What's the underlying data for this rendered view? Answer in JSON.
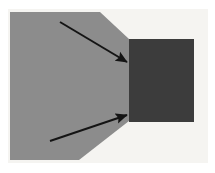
{
  "figure": {
    "title": "Grayscale schematic: wedge-shaped gray region meeting a dark rectangular block",
    "width": 215,
    "height": 173,
    "background_color": "#f5f4f1",
    "canvas_color": "#ffffff"
  },
  "colors": {
    "background": "#f5f4f1",
    "gray_region": "#8c8c8c",
    "dark_block": "#3c3c3c",
    "arrow": "#141414",
    "page": "#ffffff"
  },
  "shapes": {
    "gray_region": {
      "name": "gray-wedge-region",
      "fill": "#8c8c8c",
      "description": "Large gray polygon occupying the left portion, with chamfered upper-right and lower-right corners converging toward the dark block",
      "points": "10,12 100,12 129,39 129,121 79,160 10,160"
    },
    "dark_block": {
      "name": "dark-rectangular-block",
      "fill": "#3c3c3c",
      "description": "Dark charcoal rectangle abutting the right side of the gray region",
      "x": 129,
      "y": 39,
      "width": 65,
      "height": 83
    },
    "background_panel": {
      "name": "figure-background-panel",
      "fill": "#f5f4f1",
      "x": 8,
      "y": 9,
      "width": 200,
      "height": 154
    }
  },
  "arrows": [
    {
      "name": "upper-arrow",
      "label": "",
      "color": "#141414",
      "direction": "down-right",
      "x1": 60,
      "y1": 22,
      "x2": 127,
      "y2": 62,
      "stroke_width": 2,
      "head_length": 9,
      "head_width": 6
    },
    {
      "name": "lower-arrow",
      "label": "",
      "color": "#141414",
      "direction": "up-right",
      "x1": 50,
      "y1": 141,
      "x2": 127,
      "y2": 115,
      "stroke_width": 2,
      "head_length": 9,
      "head_width": 6
    }
  ],
  "annotations": {
    "visible_text": [],
    "note": "No text labels are visible in the figure."
  }
}
